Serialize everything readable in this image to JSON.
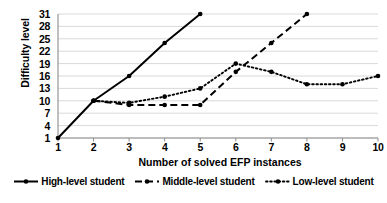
{
  "chart_data": {
    "type": "line",
    "title": "",
    "xlabel": "Number of solved EFP instances",
    "ylabel": "Difficulty level",
    "x": [
      1,
      2,
      3,
      4,
      5,
      6,
      7,
      8,
      9,
      10
    ],
    "xticklabels": [
      "1",
      "2",
      "3",
      "4",
      "5",
      "6",
      "7",
      "8",
      "9",
      "10"
    ],
    "yticklabels": [
      "1",
      "4",
      "7",
      "10",
      "13",
      "16",
      "19",
      "22",
      "25",
      "28",
      "31"
    ],
    "yticks": [
      1,
      4,
      7,
      10,
      13,
      16,
      19,
      22,
      25,
      28,
      31
    ],
    "xlim": [
      1,
      10
    ],
    "ylim": [
      1,
      31
    ],
    "grid": "horizontal",
    "legend_position": "bottom",
    "series": [
      {
        "name": "High-level student",
        "style": "solid",
        "marker": "circle",
        "color": "#000000",
        "x": [
          1,
          2,
          3,
          4,
          5
        ],
        "values": [
          1,
          10,
          16,
          24,
          31
        ]
      },
      {
        "name": "Middle-level student",
        "style": "dashed",
        "marker": "circle",
        "color": "#000000",
        "x": [
          2,
          3,
          4,
          5,
          6,
          7,
          8
        ],
        "values": [
          10,
          9,
          9,
          9,
          17,
          24,
          31
        ]
      },
      {
        "name": "Low-level student",
        "style": "dotted",
        "marker": "circle",
        "color": "#000000",
        "x": [
          2,
          3,
          4,
          5,
          6,
          7,
          8,
          9,
          10
        ],
        "values": [
          10,
          9.5,
          11,
          13,
          19,
          17,
          14,
          14,
          16
        ]
      }
    ]
  },
  "axes": {
    "ylabel": "Difficulty level",
    "xlabel": "Number of solved EFP instances"
  },
  "legend": {
    "items": [
      {
        "label": "High-level student",
        "style": "solid"
      },
      {
        "label": "Middle-level student",
        "style": "dashed"
      },
      {
        "label": "Low-level student",
        "style": "dotted"
      }
    ]
  }
}
